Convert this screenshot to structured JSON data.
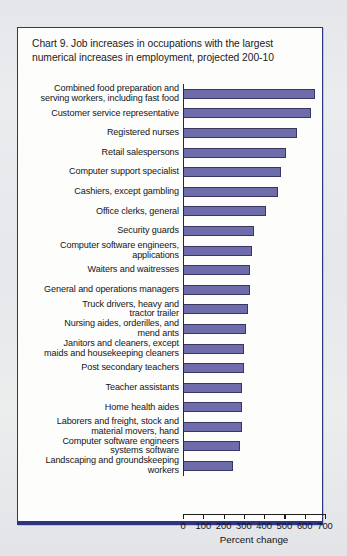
{
  "chart_panel": {
    "title": "Chart 9. Job increases in occupations with the largest numerical increases in employment, projected 200-10"
  },
  "chart_data": {
    "type": "bar",
    "orientation": "horizontal",
    "title": "Chart 9. Job increases in occupations with the largest numerical increases in employment, projected 200-10",
    "xlabel": "Percent change",
    "ylabel": "",
    "xlim": [
      0,
      700
    ],
    "xticks": [
      0,
      100,
      200,
      300,
      400,
      500,
      600,
      700
    ],
    "xtick_labels": [
      "0",
      "100",
      "200",
      "300",
      "400",
      "500",
      "600",
      "700"
    ],
    "grid": false,
    "legend": null,
    "bar_color": "#6f6cab",
    "bar_edge_color": "#3a3663",
    "categories": [
      "Combined food preparation and\nserving workers, including fast food",
      "Customer service representative",
      "Registered nurses",
      "Retail salespersons",
      "Computer support specialist",
      "Cashiers, except gambling",
      "Office clerks, general",
      "Security guards",
      "Computer software engineers,\napplications",
      "Waiters and waitresses",
      "General and operations managers",
      "Truck drivers, heavy and\ntractor trailer",
      "Nursing aides, orderilles, and\nmend ants",
      "Janitors and cleaners, except\nmaids and housekeeping cleaners",
      "Post secondary teachers",
      "Teacher assistants",
      "Home health aides",
      "Laborers and freight, stock and\nmaterial movers, hand",
      "Computer software engineers\nsystems software",
      "Landscaping and groundskeeping\nworkers"
    ],
    "values": [
      650,
      630,
      560,
      510,
      485,
      470,
      410,
      350,
      340,
      330,
      330,
      320,
      310,
      300,
      300,
      290,
      290,
      290,
      283,
      247
    ]
  }
}
